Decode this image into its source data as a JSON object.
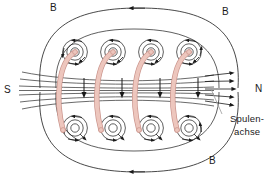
{
  "figure": {
    "title_alt": "Magnetfeld einer stromdurchflossenen Spule",
    "labels": {
      "b_top_left": "B",
      "b_top_right": "B",
      "b_bottom": "B",
      "pole_south": "S",
      "pole_north": "N",
      "coil_axis_line1": "Spulen-",
      "coil_axis_line2": "achse"
    },
    "colors": {
      "wire": "#edc6bd",
      "wire_edge": "#c9928a",
      "field_line": "#1a1a1a",
      "axis_line": "#808080",
      "background": "#ffffff",
      "text": "#1a1a1a"
    },
    "geometry": {
      "width": 278,
      "height": 180,
      "windings": 4,
      "winding_x": [
        75,
        113,
        151,
        189
      ],
      "spiral_top_y": 52,
      "spiral_bottom_y": 128,
      "axis_y": 90,
      "axis_field_lines": 7,
      "north_arrowheads": 5,
      "outer_loop_top_arrow": "left",
      "outer_loop_bottom_arrow": "left"
    },
    "annotations": {
      "field_direction_in_core": "downward",
      "field_direction_outside": "left-to-right along axis toward N",
      "concentric_rings_per_winding": 3
    }
  }
}
